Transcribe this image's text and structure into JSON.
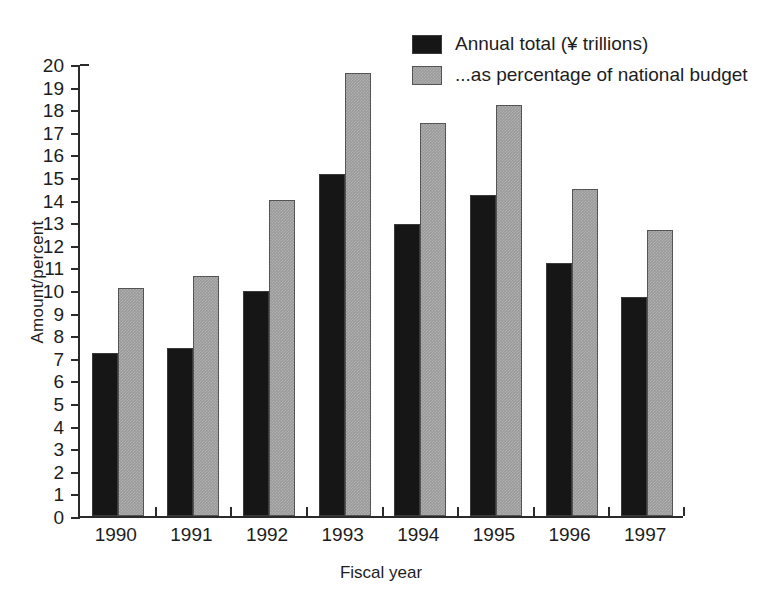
{
  "chart_data": {
    "type": "bar",
    "title": "",
    "xlabel": "Fiscal year",
    "ylabel": "Amount/percent",
    "categories": [
      "1990",
      "1991",
      "1992",
      "1993",
      "1994",
      "1995",
      "1996",
      "1997"
    ],
    "series": [
      {
        "name": "Annual total (¥ trillions)",
        "color": "#161616",
        "values": [
          7.2,
          7.45,
          9.95,
          15.15,
          12.9,
          14.2,
          11.2,
          9.7
        ]
      },
      {
        "name": "...as percentage of national budget",
        "color": "#9a9a9a",
        "values": [
          10.1,
          10.6,
          14.0,
          19.6,
          17.4,
          18.2,
          14.45,
          12.65
        ]
      }
    ],
    "ylim": [
      0,
      20
    ],
    "yticks": [
      0,
      1,
      2,
      3,
      4,
      5,
      6,
      7,
      8,
      9,
      10,
      11,
      12,
      13,
      14,
      15,
      16,
      17,
      18,
      19,
      20
    ],
    "ytick_labels": [
      "0",
      "1",
      "2",
      "3",
      "4",
      "5",
      "6",
      "7",
      "8",
      "9",
      "10",
      "11",
      "12",
      "13",
      "14",
      "15",
      "16",
      "17",
      "18",
      "19",
      "20"
    ],
    "grid": false,
    "legend_position": "top-right"
  },
  "legend": {
    "items": [
      {
        "label": "Annual total (¥ trillions)",
        "style": "dark"
      },
      {
        "label": "...as percentage of national budget",
        "style": "light"
      }
    ]
  },
  "axes": {
    "y_title": "Amount/percent",
    "x_title": "Fiscal year"
  }
}
